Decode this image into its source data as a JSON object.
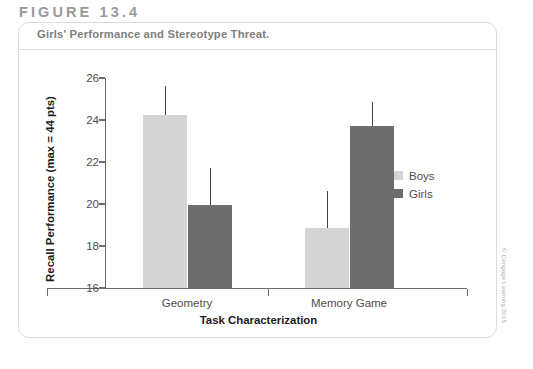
{
  "figure": {
    "number_label": "FIGURE 13.4",
    "caption": "Girls' Performance and Stereotype Threat."
  },
  "credit": {
    "text": "© Cengage Learning 2015"
  },
  "colors": {
    "boys": "#d4d4d4",
    "girls": "#6d6d6d",
    "axis": "#6e6e6e",
    "error_bar": "#454545",
    "card_border": "#dcdcdc",
    "figure_number": "#9a9a9a",
    "caption": "#808080"
  },
  "chart_data": {
    "type": "bar",
    "title": "Girls' Performance and Stereotype Threat.",
    "xlabel": "Task Characterization",
    "ylabel": "Recall Performance (max = 44 pts)",
    "categories": [
      "Geometry",
      "Memory Game"
    ],
    "ylim": [
      16,
      26
    ],
    "yticks": [
      16,
      18,
      20,
      22,
      24,
      26
    ],
    "ytick_labels": [
      "16",
      "18",
      "20",
      "22",
      "24",
      "26"
    ],
    "grid": false,
    "legend_position": "right",
    "series": [
      {
        "name": "Boys",
        "color": "#d4d4d4",
        "values": [
          24.25,
          18.85
        ],
        "error_upper": [
          25.6,
          20.6
        ]
      },
      {
        "name": "Girls",
        "color": "#6d6d6d",
        "values": [
          19.95,
          23.7
        ],
        "error_upper": [
          21.7,
          24.85
        ]
      }
    ]
  }
}
